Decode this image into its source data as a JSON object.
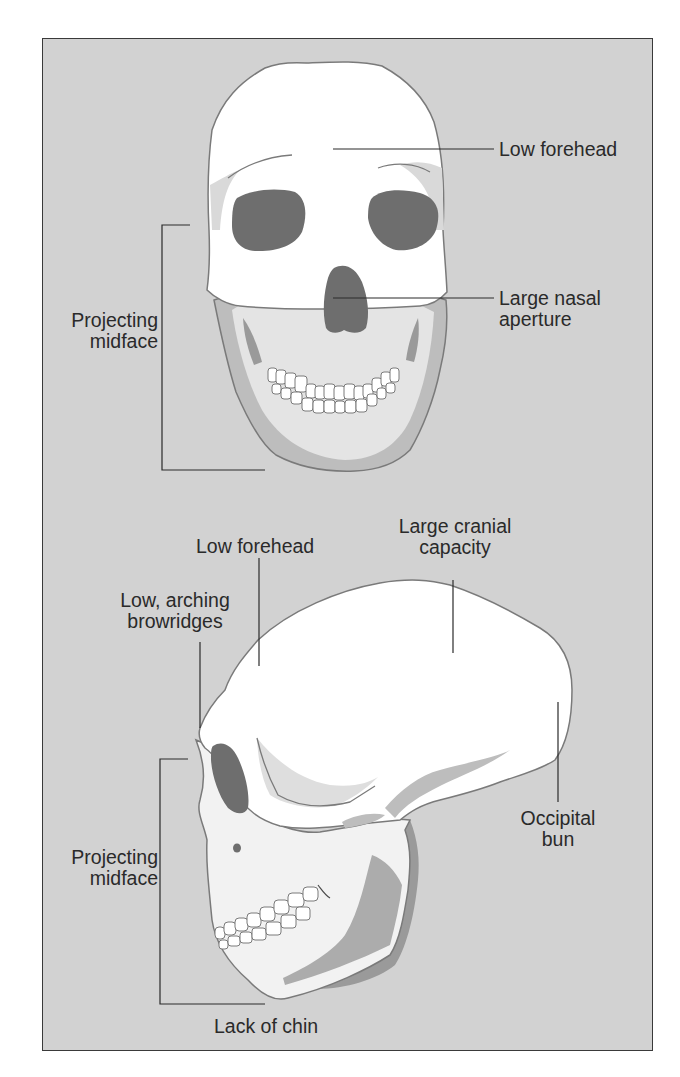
{
  "figure": {
    "background_color": "#d2d2d2",
    "bone_color": "#ffffff",
    "shadow_color": "#bdbdbd",
    "dark_shadow_color": "#9a9a9a",
    "cavity_color": "#6e6e6e",
    "outline_color": "#7a7a7a",
    "leader_color": "#2a2a2a"
  },
  "frontal_view": {
    "labels": {
      "low_forehead": {
        "lines": [
          "Low forehead"
        ]
      },
      "large_nasal_aperture": {
        "lines": [
          "Large nasal",
          "aperture"
        ]
      },
      "projecting_midface": {
        "lines": [
          "Projecting",
          "midface"
        ]
      }
    }
  },
  "lateral_view": {
    "labels": {
      "large_cranial_capacity": {
        "lines": [
          "Large cranial",
          "capacity"
        ]
      },
      "low_forehead": {
        "lines": [
          "Low forehead"
        ]
      },
      "low_arching_browridges": {
        "lines": [
          "Low, arching",
          "browridges"
        ]
      },
      "occipital_bun": {
        "lines": [
          "Occipital",
          "bun"
        ]
      },
      "projecting_midface": {
        "lines": [
          "Projecting",
          "midface"
        ]
      },
      "lack_of_chin": {
        "lines": [
          "Lack of chin"
        ]
      }
    }
  }
}
